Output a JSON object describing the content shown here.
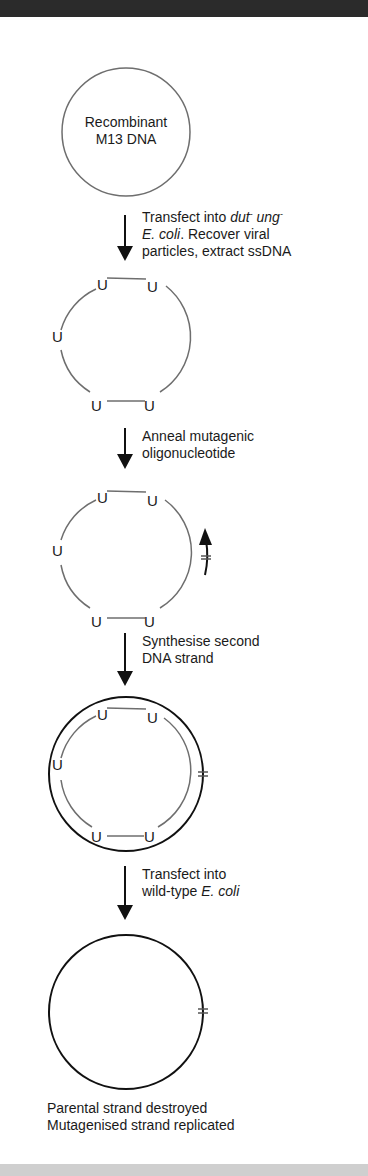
{
  "diagram": {
    "start_node": {
      "line1": "Recombinant",
      "line2": "M13 DNA"
    },
    "steps": [
      {
        "id": 1,
        "parts": [
          "Transfect into ",
          "dut",
          "-",
          " ",
          "ung",
          "-",
          "E. coli",
          ". Recover viral",
          "particles, extract ssDNA"
        ]
      },
      {
        "id": 2,
        "line1": "Anneal mutagenic",
        "line2": "oligonucleotide"
      },
      {
        "id": 3,
        "line1": "Synthesise second",
        "line2": "DNA strand"
      },
      {
        "id": 4,
        "line1": "Transfect into",
        "line2_prefix": "wild-type ",
        "line2_italic": "E. coli"
      }
    ],
    "uracil_label": "U",
    "mutation_mark": "*",
    "outcome": {
      "line1": "Parental strand destroyed",
      "line2": "Mutagenised strand replicated"
    },
    "colors": {
      "parental_strand": "#6e6e6e",
      "new_strand": "#111111",
      "top_bar": "#2b2b2b",
      "bottom_bar": "#cfcfcf"
    }
  }
}
